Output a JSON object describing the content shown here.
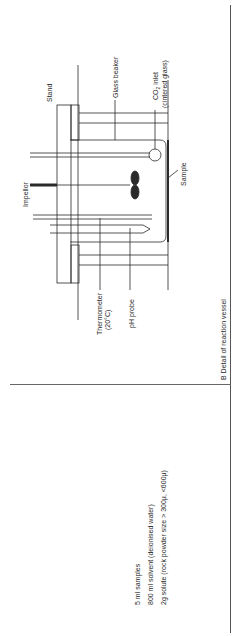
{
  "figure": {
    "panel_b_caption": "B   Detail  of  reaction  vessel",
    "labels": {
      "stand": "Stand",
      "glass_beaker": "Glass  beaker",
      "co2_inlet_line1": "CO",
      "co2_inlet_sub": "2",
      "co2_inlet_rest": " inlet",
      "co2_inlet_line2": "(cintered  glass)",
      "impellor": "Impellor",
      "sample": "Sample",
      "thermometer_line1": "Thermometer",
      "thermometer_line2": "(20°C)",
      "ph_probe": "pH  probe"
    },
    "conditions": [
      "5 ml  samples",
      "800 ml  solvent (deionised  water)",
      "2g  solute (rock  powder  size > 300μ, <600μ)"
    ]
  },
  "colors": {
    "ink": "#2a2a2a",
    "rule": "#555555",
    "background": "#ffffff"
  }
}
